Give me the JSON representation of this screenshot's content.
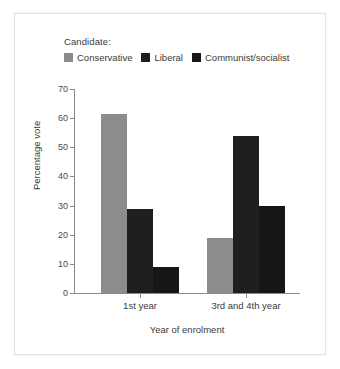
{
  "legend": {
    "title": "Candidate:",
    "entries": [
      {
        "label": "Conservative",
        "color": "#8c8c8c"
      },
      {
        "label": "Liberal",
        "color": "#1f1f1f"
      },
      {
        "label": "Communist/socialist",
        "color": "#161616"
      }
    ]
  },
  "axes": {
    "y_title": "Percentage vote",
    "x_title": "Year of enrolment",
    "y_ticks": [
      0,
      10,
      20,
      30,
      40,
      50,
      60,
      70
    ]
  },
  "chart_data": {
    "type": "bar",
    "title": "",
    "xlabel": "Year of enrolment",
    "ylabel": "Percentage vote",
    "categories": [
      "1st year",
      "3rd and 4th year"
    ],
    "series": [
      {
        "name": "Conservative",
        "color": "#8c8c8c",
        "values": [
          61.5,
          19
        ]
      },
      {
        "name": "Liberal",
        "color": "#1f1f1f",
        "values": [
          29,
          54
        ]
      },
      {
        "name": "Communist/socialist",
        "color": "#161616",
        "values": [
          9,
          30
        ]
      }
    ],
    "ylim": [
      0,
      70
    ],
    "ytick_step": 10,
    "grid": false,
    "legend_position": "top-left",
    "legend_title": "Candidate:"
  }
}
